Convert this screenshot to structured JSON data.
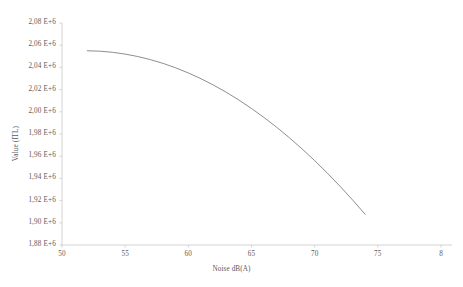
{
  "chart_data": {
    "type": "line",
    "title": "",
    "xlabel": "Noise  dB(A)",
    "ylabel": "Value (ITL)",
    "xlim": [
      50,
      80
    ],
    "ylim": [
      1880000,
      2080000
    ],
    "xticks": [
      50,
      55,
      60,
      65,
      70,
      75,
      80
    ],
    "xtick_labels": [
      "50",
      "55",
      "60",
      "65",
      "70",
      "75",
      "8"
    ],
    "yticks": [
      1880000,
      1900000,
      1920000,
      1940000,
      1960000,
      1980000,
      2000000,
      2020000,
      2040000,
      2060000,
      2080000
    ],
    "ytick_labels": [
      "1,88 E+6",
      "1,90 E+6",
      "1,92 E+6",
      "1,94 E+6",
      "1,96 E+6",
      "1,98 E+6",
      "2,00 E+6",
      "2,02 E+6",
      "2,04 E+6",
      "2,06 E+6",
      "2,08 E+6"
    ],
    "grid": false,
    "legend": null,
    "line_color": "#7a7a7a",
    "axis_color": "#c8c8c8",
    "series": [
      {
        "name": "value-vs-noise",
        "x": [
          52.0,
          53.0,
          54.0,
          55.0,
          56.0,
          57.0,
          58.0,
          59.0,
          60.0,
          61.0,
          62.0,
          63.0,
          64.0,
          65.0,
          66.0,
          67.0,
          68.0,
          69.0,
          70.0,
          71.0,
          72.0,
          73.0,
          74.0
        ],
        "y": [
          2055000,
          2054600,
          2053600,
          2052000,
          2049800,
          2047000,
          2043600,
          2039600,
          2035000,
          2029800,
          2024000,
          2017600,
          2010600,
          2003000,
          1994800,
          1986000,
          1976600,
          1966600,
          1956000,
          1944800,
          1933000,
          1920600,
          1907600
        ]
      }
    ]
  },
  "axis_geometry": {
    "plot_left_px": 62,
    "plot_right_px": 441,
    "plot_top_px": 23,
    "plot_bottom_px": 245
  }
}
